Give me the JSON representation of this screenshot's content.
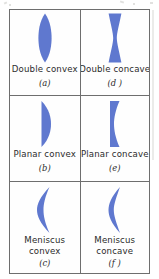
{
  "figure": {
    "type": "lens-types-table",
    "accent_color": "#5f78cf",
    "border_color": "#6e6e6e",
    "text_color": "#2b2b2b",
    "columns": 2,
    "rows": 3,
    "cells": [
      {
        "id": "double-convex",
        "label": "Double convex",
        "tag": "(a)",
        "icon": "lens-double-convex-icon",
        "position": "top-left"
      },
      {
        "id": "double-concave",
        "label": "Double concave",
        "tag": "(d )",
        "icon": "lens-double-concave-icon",
        "position": "top-right"
      },
      {
        "id": "planar-convex",
        "label": "Planar convex",
        "tag": "(b)",
        "icon": "lens-planar-convex-icon",
        "position": "middle-left"
      },
      {
        "id": "planar-concave",
        "label": "Planar concave",
        "tag": "(e)",
        "icon": "lens-planar-concave-icon",
        "position": "middle-right"
      },
      {
        "id": "meniscus-convex",
        "label_line1": "Meniscus",
        "label_line2": "convex",
        "tag": "(c)",
        "icon": "lens-meniscus-convex-icon",
        "position": "bottom-left"
      },
      {
        "id": "meniscus-concave",
        "label_line1": "Meniscus",
        "label_line2": "concave",
        "tag": "(f )",
        "icon": "lens-meniscus-concave-icon",
        "position": "bottom-right"
      }
    ]
  }
}
